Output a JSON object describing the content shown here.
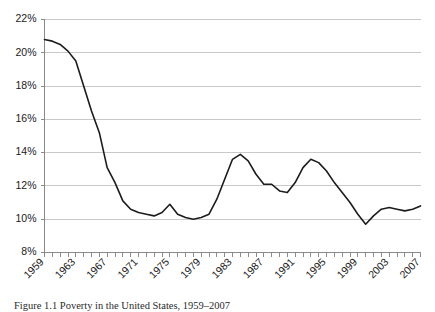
{
  "chart_data": {
    "type": "line",
    "title": "",
    "xlabel": "",
    "ylabel": "",
    "ylim": [
      8,
      22
    ],
    "ytick_step": 2,
    "ytick_labels": [
      "22%",
      "20%",
      "18%",
      "16%",
      "14%",
      "12%",
      "10%",
      "8%"
    ],
    "ytick_values": [
      22,
      20,
      18,
      16,
      14,
      12,
      10,
      8
    ],
    "xlim": [
      1959,
      2007
    ],
    "xtick_labels": [
      "1959",
      "1963",
      "1967",
      "1971",
      "1975",
      "1979",
      "1983",
      "1987",
      "1991",
      "1995",
      "1999",
      "2003",
      "2007"
    ],
    "xtick_values": [
      1959,
      1963,
      1967,
      1971,
      1975,
      1979,
      1983,
      1987,
      1991,
      1995,
      1999,
      2003,
      2007
    ],
    "xtick_minor_step": 1,
    "grid": "horizontal",
    "legend": "none",
    "line_color": "#1c1c1c",
    "grid_color": "#c9c9c9",
    "axis_color": "#8a8a8a",
    "x": [
      1959,
      1960,
      1961,
      1962,
      1963,
      1964,
      1965,
      1966,
      1967,
      1968,
      1969,
      1970,
      1971,
      1972,
      1973,
      1974,
      1975,
      1976,
      1977,
      1978,
      1979,
      1980,
      1981,
      1982,
      1983,
      1984,
      1985,
      1986,
      1987,
      1988,
      1989,
      1990,
      1991,
      1992,
      1993,
      1994,
      1995,
      1996,
      1997,
      1998,
      1999,
      2000,
      2001,
      2002,
      2003,
      2004,
      2005,
      2006,
      2007
    ],
    "values": [
      20.8,
      20.7,
      20.5,
      20.1,
      19.5,
      18.0,
      16.5,
      15.2,
      13.1,
      12.2,
      11.1,
      10.6,
      10.4,
      10.3,
      10.2,
      10.4,
      10.9,
      10.3,
      10.1,
      10.0,
      10.1,
      10.3,
      11.2,
      12.4,
      13.6,
      13.9,
      13.5,
      12.7,
      12.1,
      12.1,
      11.7,
      11.6,
      12.2,
      13.1,
      13.6,
      13.4,
      12.9,
      12.2,
      11.6,
      11.0,
      10.3,
      9.7,
      10.2,
      10.6,
      10.7,
      10.6,
      10.5,
      10.6,
      10.8
    ]
  },
  "caption": {
    "text": "Figure 1.1   Poverty in the United States, 1959–2007"
  }
}
